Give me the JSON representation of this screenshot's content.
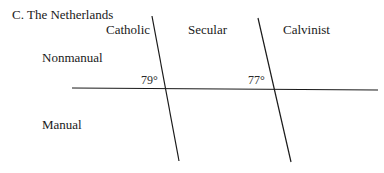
{
  "figure": {
    "title": "C.  The Netherlands"
  },
  "columns": [
    {
      "label": "Catholic"
    },
    {
      "label": "Secular"
    },
    {
      "label": "Calvinist"
    }
  ],
  "rows": [
    {
      "label": "Nonmanual"
    },
    {
      "label": "Manual"
    }
  ],
  "dividers": [
    {
      "angle_label": "79°",
      "angle": 79
    },
    {
      "angle_label": "77°",
      "angle": 77
    }
  ],
  "colors": {
    "line": "#1a1a1a",
    "text": "#1a1a1a",
    "background": "#ffffff"
  }
}
